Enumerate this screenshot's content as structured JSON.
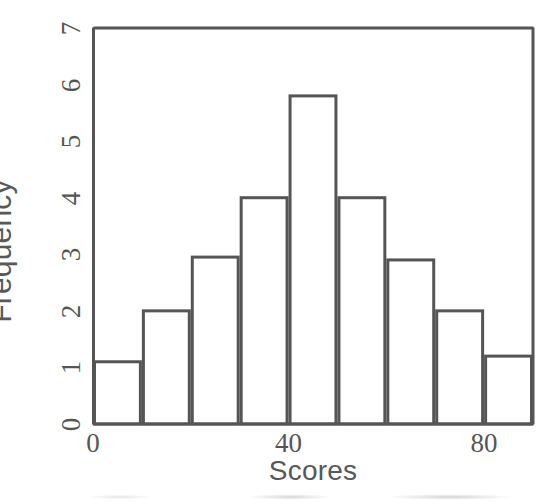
{
  "chart_data": {
    "type": "bar",
    "title": "",
    "subtitle": "",
    "xlabel": "Scores",
    "ylabel": "Frequency",
    "categories": [
      "0-10",
      "10-20",
      "20-30",
      "30-40",
      "40-50",
      "50-60",
      "60-70",
      "70-80",
      "80-90"
    ],
    "bin_edges": [
      0,
      10,
      20,
      30,
      40,
      50,
      60,
      70,
      80,
      90
    ],
    "values": [
      1.1,
      2,
      2.95,
      4,
      5.8,
      4,
      2.9,
      2,
      1.2
    ],
    "xlim": [
      0,
      90
    ],
    "ylim": [
      0,
      7
    ],
    "xticks": [
      0,
      40,
      80
    ],
    "xtick_labels": [
      "0",
      "40",
      "80"
    ],
    "yticks": [
      0,
      1,
      2,
      3,
      4,
      5,
      6,
      7
    ],
    "ytick_labels": [
      "0",
      "1",
      "2",
      "3",
      "4",
      "5",
      "6",
      "7"
    ],
    "grid": false,
    "legend": null,
    "bar_fill": "#ffffff",
    "bar_edge_color": "#555555",
    "axis_color": "#555555",
    "label_color": "#585858",
    "background": "#ffffff"
  }
}
